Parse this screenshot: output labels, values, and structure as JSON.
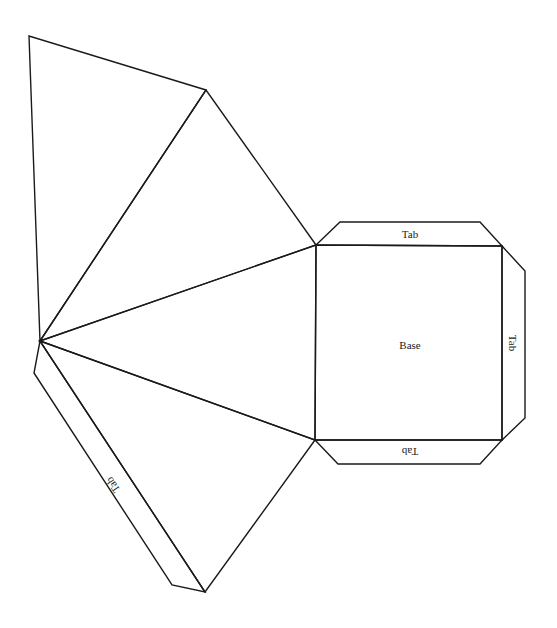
{
  "diagram": {
    "labels": {
      "base": "Base",
      "tab_top": "Tab",
      "tab_right": "Tab",
      "tab_bottom": "Tab",
      "tab_side": "Tab"
    },
    "colors": {
      "stroke": "#1a1a1a",
      "background": "#ffffff"
    }
  }
}
